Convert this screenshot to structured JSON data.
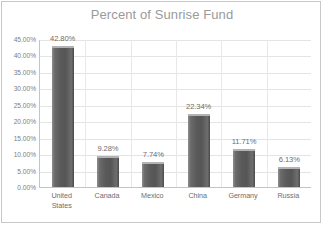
{
  "chart_data": {
    "type": "bar",
    "title": "Percent of Sunrise Fund",
    "xlabel": "",
    "ylabel": "",
    "categories": [
      "United States",
      "Canada",
      "Mexico",
      "China",
      "Germany",
      "Russia"
    ],
    "category_lines": [
      [
        "United",
        "States"
      ],
      [
        "Canada"
      ],
      [
        "Mexico"
      ],
      [
        "China"
      ],
      [
        "Germany"
      ],
      [
        "Russia"
      ]
    ],
    "values": [
      42.8,
      9.28,
      7.74,
      22.34,
      11.71,
      6.13
    ],
    "data_labels": [
      "42.80%",
      "9.28%",
      "7.74%",
      "22.34%",
      "11.71%",
      "6.13%"
    ],
    "ylim": [
      0,
      45
    ],
    "ytick_step": 5,
    "ytick_labels": [
      "45.00%",
      "40.00%",
      "35.00%",
      "30.00%",
      "25.00%",
      "20.00%",
      "15.00%",
      "10.00%",
      "5.00%",
      "0.00%"
    ],
    "ytick_values": [
      45,
      40,
      35,
      30,
      25,
      20,
      15,
      10,
      5,
      0
    ],
    "grid": true,
    "legend": false,
    "series_color": "#595959",
    "grid_color": "#e4e4e4",
    "axis_color": "#c4c4c4",
    "title_color": "#9a9a9a",
    "label_color": "#6e6e6e"
  }
}
